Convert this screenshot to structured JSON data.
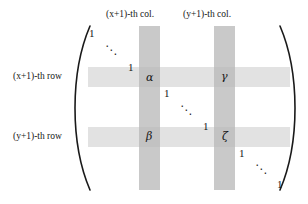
{
  "figure": {
    "kind": "matrix-diagram",
    "bracket_left": "(",
    "bracket_right": ")"
  },
  "column_labels": [
    {
      "id": "col-x",
      "text": "(x+1)-th col."
    },
    {
      "id": "col-y",
      "text": "(y+1)-th col."
    }
  ],
  "row_labels": [
    {
      "id": "row-x",
      "text": "(x+1)-th row"
    },
    {
      "id": "row-y",
      "text": "(y+1)-th row"
    }
  ],
  "entries": [
    {
      "id": "entry-alpha",
      "symbol": "α",
      "row": "(x+1)",
      "col": "(x+1)"
    },
    {
      "id": "entry-gamma",
      "symbol": "γ",
      "row": "(x+1)",
      "col": "(y+1)"
    },
    {
      "id": "entry-beta",
      "symbol": "β",
      "row": "(y+1)",
      "col": "(x+1)"
    },
    {
      "id": "entry-zeta",
      "symbol": "ζ",
      "row": "(y+1)",
      "col": "(y+1)"
    }
  ],
  "diagonal_ones": [
    {
      "id": "one-1",
      "text": "1"
    },
    {
      "id": "one-2",
      "text": "1"
    },
    {
      "id": "one-3",
      "text": "1"
    },
    {
      "id": "one-4",
      "text": "1"
    },
    {
      "id": "one-5",
      "text": "1"
    },
    {
      "id": "one-6",
      "text": "1"
    }
  ],
  "ellipses": [
    {
      "id": "ddots-1",
      "glyph": "⋱"
    },
    {
      "id": "ddots-2",
      "glyph": "⋱"
    },
    {
      "id": "ddots-3",
      "glyph": "⋱"
    }
  ],
  "colors": {
    "background": "#ffffff",
    "column_highlight": "#c9c9c9",
    "row_highlight": "#e2e2e2",
    "cross_highlight": "#c2c2c2",
    "ink": "#161616"
  }
}
